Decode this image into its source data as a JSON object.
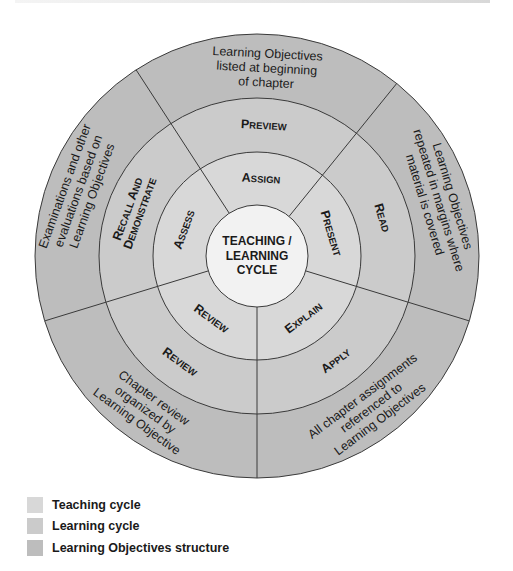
{
  "diagram": {
    "center_label_lines": [
      "TEACHING /",
      "LEARNING",
      "CYCLE"
    ],
    "geometry": {
      "cx": 257,
      "cy": 256,
      "r_center": 51,
      "r_teaching": 104,
      "r_learning": 158,
      "r_outer": 222,
      "divider_angles_deg": [
        -33,
        39,
        107,
        180,
        253
      ]
    },
    "colors": {
      "teaching": "#d8d8d8",
      "learning": "#cbcbcb",
      "objectives": "#bdbdbd",
      "center": "#f2f2f2",
      "lines": "#3a3a3a"
    },
    "teaching_cycle": [
      {
        "label": "Assign",
        "angle": 3
      },
      {
        "label": "Present",
        "angle": 73
      },
      {
        "label": "Explain",
        "angle": 143
      },
      {
        "label": "Review",
        "angle": 216
      },
      {
        "label": "Assess",
        "angle": 290
      }
    ],
    "learning_cycle": [
      {
        "label": "Preview",
        "angle": 3
      },
      {
        "label": "Read",
        "angle": 73
      },
      {
        "label": "Apply",
        "angle": 143
      },
      {
        "label": "Review",
        "angle": 216
      },
      {
        "label": "Recall and Demonstrate",
        "lines": [
          "Recall and",
          "Demonstrate"
        ],
        "angle": 290
      }
    ],
    "learning_objectives_structure": [
      {
        "lines": [
          "Learning Objectives",
          "listed at beginning",
          "of chapter"
        ],
        "angle": 3
      },
      {
        "lines": [
          "Learning Objectives",
          "repeated in margins where",
          "material is covered"
        ],
        "angle": 73
      },
      {
        "lines": [
          "All chapter assignments",
          "referenced to",
          "Learning Objectives"
        ],
        "angle": 143
      },
      {
        "lines": [
          "Chapter review",
          "organized by",
          "Learning Objective"
        ],
        "angle": 216
      },
      {
        "lines": [
          "Examinations and other",
          "evaluations based on",
          "Learning Objectives"
        ],
        "angle": 290
      }
    ]
  },
  "legend": {
    "items": [
      {
        "label": "Teaching cycle",
        "color": "#d8d8d8"
      },
      {
        "label": "Learning cycle",
        "color": "#cbcbcb"
      },
      {
        "label": "Learning Objectives structure",
        "color": "#bdbdbd"
      }
    ]
  }
}
